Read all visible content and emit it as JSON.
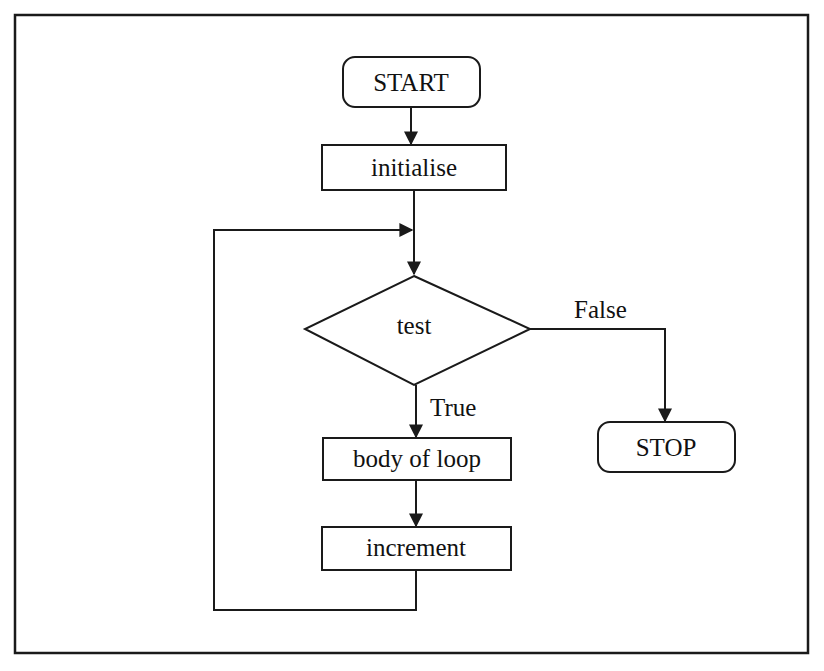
{
  "diagram": {
    "type": "flowchart",
    "nodes": {
      "start": {
        "label": "START",
        "shape": "terminal"
      },
      "initialise": {
        "label": "initialise",
        "shape": "process"
      },
      "test": {
        "label": "test",
        "shape": "decision"
      },
      "body": {
        "label": "body of loop",
        "shape": "process"
      },
      "increment": {
        "label": "increment",
        "shape": "process"
      },
      "stop": {
        "label": "STOP",
        "shape": "terminal"
      }
    },
    "edges": {
      "true_label": "True",
      "false_label": "False"
    },
    "connections": [
      {
        "from": "START",
        "to": "initialise"
      },
      {
        "from": "initialise",
        "to": "test"
      },
      {
        "from": "test",
        "to": "body of loop",
        "label": "True"
      },
      {
        "from": "test",
        "to": "STOP",
        "label": "False"
      },
      {
        "from": "body of loop",
        "to": "increment"
      },
      {
        "from": "increment",
        "to": "test",
        "label": "loop back"
      }
    ],
    "colors": {
      "stroke": "#1a1a1a",
      "background": "#ffffff"
    }
  }
}
